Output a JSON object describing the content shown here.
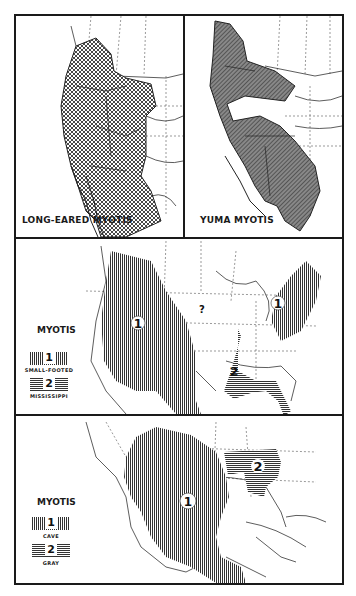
{
  "figure": {
    "panels": [
      {
        "id": "long-eared",
        "caption": "LONG-EARED MYOTIS",
        "pattern": "crosshatch",
        "region": "Western North America: British Columbia south through western U.S. to northern Mexico and Baja California"
      },
      {
        "id": "yuma",
        "caption": "YUMA MYOTIS",
        "pattern": "diagonal-lines",
        "region": "Western North America: British Columbia south through western U.S. (gap in Great Basin) into Mexico"
      },
      {
        "id": "small-footed-mississippi",
        "legend_title": "MYOTIS",
        "legend": [
          {
            "number": "1",
            "label": "SMALL-FOOTED",
            "pattern": "vertical-lines"
          },
          {
            "number": "2",
            "label": "MISSISSIPPI",
            "pattern": "horizontal-lines"
          }
        ],
        "map_labels": [
          "1",
          "1",
          "2",
          "?"
        ]
      },
      {
        "id": "cave-gray",
        "legend_title": "MYOTIS",
        "legend": [
          {
            "number": "1",
            "label": "CAVE",
            "pattern": "vertical-lines"
          },
          {
            "number": "2",
            "label": "GRAY",
            "pattern": "horizontal-lines"
          }
        ],
        "map_labels": [
          "1",
          "2"
        ]
      }
    ]
  }
}
